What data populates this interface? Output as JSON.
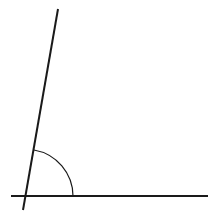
{
  "diagram": {
    "type": "angle",
    "colors": {
      "stroke": "#1a1a1a",
      "background": "#ffffff"
    },
    "horizontal_line": {
      "x1": 11,
      "y1": 196,
      "x2": 208,
      "y2": 196
    },
    "slanted_line": {
      "x1": 58,
      "y1": 9,
      "x2": 23,
      "y2": 210
    },
    "vertex": {
      "x": 26,
      "y": 196
    },
    "angle_arc": {
      "start_x": 34,
      "start_y": 150,
      "end_x": 73,
      "end_y": 196,
      "radius": 47
    }
  }
}
